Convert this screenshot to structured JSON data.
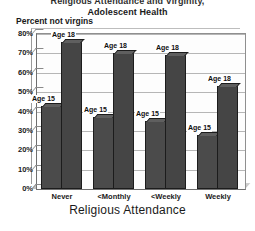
{
  "chart_data": {
    "type": "bar",
    "title": "Adolescent Health",
    "title_lines": [
      "Religious Attendance and Virginity,",
      "Adolescent Health"
    ],
    "ylabel": "Percent not virgins",
    "xlabel": "Religious Attendance",
    "categories": [
      "Never",
      "<Monthly",
      "<Weekly",
      "Weekly"
    ],
    "series": [
      {
        "name": "Age 15",
        "values": [
          43,
          37,
          35,
          28
        ]
      },
      {
        "name": "Age 18",
        "values": [
          76,
          70,
          69,
          53
        ]
      }
    ],
    "point_labels": {
      "age15": [
        "Age 15",
        "Age 15",
        "Age 15",
        "Age 15"
      ],
      "age18": [
        "Age 18",
        "Age 18",
        "Age 18",
        "Age 18"
      ]
    },
    "ylim": [
      0,
      80
    ],
    "ytick_values": [
      0,
      10,
      20,
      30,
      40,
      50,
      60,
      70,
      80
    ],
    "ytick_labels": [
      "0%",
      "10%",
      "20%",
      "30%",
      "40%",
      "50%",
      "60%",
      "70%",
      "80%"
    ],
    "grid": true,
    "legend": "none",
    "colors": {
      "bar_fill": "#4a4a4a",
      "bar_edge": "#1c1c1c",
      "bar_top": "#5f5f5f",
      "grid": "#9e9e9e",
      "axis": "#6e6e6e",
      "text": "#1a1a1a",
      "plot_bg": "#fdfdfd",
      "page_bg": "#ffffff"
    }
  }
}
